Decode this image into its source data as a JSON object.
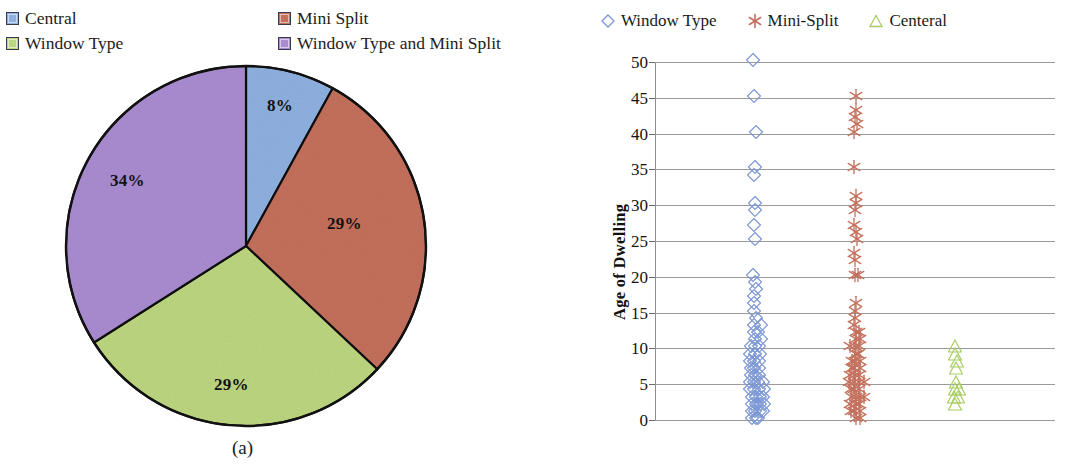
{
  "figure": {
    "subcaption_a": "(a)",
    "subcaption_b": "(b)"
  },
  "panel_a": {
    "legend": [
      {
        "label": "Central",
        "color": "#8EB0E0",
        "icon": "square-swatch-icon"
      },
      {
        "label": "Mini Split",
        "color": "#C3705C",
        "icon": "square-swatch-icon"
      },
      {
        "label": "Window Type",
        "color": "#BCD57F",
        "icon": "square-swatch-icon"
      },
      {
        "label": "Window Type and Mini Split",
        "color": "#A98CD0",
        "icon": "square-swatch-icon"
      }
    ],
    "labels": {
      "central": "8%",
      "mini_split": "29%",
      "window_type": "29%",
      "both": "34%"
    }
  },
  "panel_b": {
    "legend": [
      {
        "label": "Window Type",
        "marker": "diamond",
        "color": "#7B96D4",
        "icon": "diamond-marker-icon"
      },
      {
        "label": "Mini-Split",
        "marker": "asterisk",
        "color": "#C3705C",
        "icon": "asterisk-marker-icon"
      },
      {
        "label": "Centeral",
        "marker": "triangle",
        "color": "#A8CC62",
        "icon": "triangle-marker-icon"
      }
    ],
    "y_axis_title": "Age of Dwelling",
    "y_ticks": [
      "50",
      "45",
      "40",
      "35",
      "30",
      "25",
      "20",
      "15",
      "10",
      "5",
      "0"
    ]
  },
  "chart_data": [
    {
      "type": "pie",
      "title": "",
      "id": "panel-a-pie",
      "legend_position": "top",
      "labels": [
        "Central",
        "Mini Split",
        "Window Type",
        "Window Type and Mini Split"
      ],
      "values": [
        8,
        29,
        29,
        34
      ],
      "value_labels": [
        "8%",
        "29%",
        "29%",
        "34%"
      ],
      "colors": [
        "#8EB0E0",
        "#C3705C",
        "#BCD57F",
        "#A98CD0"
      ],
      "start_angle_deg": 0,
      "direction": "clockwise"
    },
    {
      "type": "scatter",
      "id": "panel-b-scatter",
      "title": "",
      "xlabel": "",
      "ylabel": "Age of Dwelling",
      "ylim": [
        0,
        50
      ],
      "ytick_step": 5,
      "yticks": [
        0,
        5,
        10,
        15,
        20,
        25,
        30,
        35,
        40,
        45,
        50
      ],
      "grid": "horizontal",
      "legend_position": "top",
      "xlim": [
        0,
        4
      ],
      "x_tick_labels": [],
      "series": [
        {
          "name": "Window Type",
          "marker": "diamond",
          "color": "#7B96D4",
          "x_category": 1,
          "values": [
            50,
            45,
            40,
            35,
            34,
            30,
            29,
            27,
            25,
            20,
            19,
            18,
            17,
            16,
            15,
            14,
            13,
            13,
            12,
            12,
            11,
            11,
            10,
            10,
            10,
            9,
            9,
            9,
            8,
            8,
            8,
            7,
            7,
            7,
            6,
            6,
            6,
            5,
            5,
            5,
            5,
            4,
            4,
            4,
            4,
            3,
            3,
            3,
            3,
            2,
            2,
            2,
            2,
            1,
            1,
            1,
            1,
            0,
            0,
            0
          ]
        },
        {
          "name": "Mini-Split",
          "marker": "asterisk",
          "color": "#C3705C",
          "x_category": 2,
          "values": [
            45,
            43,
            42,
            41,
            40,
            35,
            31,
            30,
            29,
            27,
            26,
            25,
            23,
            22,
            20,
            20,
            16,
            15,
            14,
            13,
            12,
            12,
            11,
            11,
            10,
            10,
            10,
            9,
            9,
            8,
            8,
            8,
            7,
            7,
            7,
            6,
            6,
            6,
            5,
            5,
            5,
            5,
            4,
            4,
            4,
            3,
            3,
            3,
            3,
            2,
            2,
            2,
            1,
            1,
            1,
            0,
            0
          ]
        },
        {
          "name": "Centeral",
          "marker": "triangle",
          "color": "#A8CC62",
          "x_category": 3,
          "values": [
            10,
            9,
            8,
            7,
            5,
            4,
            4,
            3,
            3,
            2
          ]
        }
      ]
    }
  ]
}
